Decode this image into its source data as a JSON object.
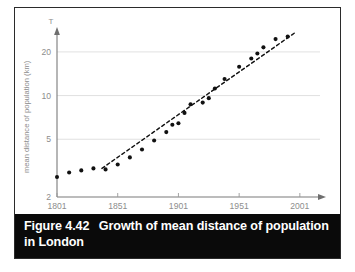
{
  "figure": {
    "caption_prefix": "Figure 4.42",
    "caption_text": "Growth of mean distance of population",
    "caption_line2": "in London",
    "caption_bg": "#0a0a0a",
    "caption_color": "#ffffff",
    "border_color": "#2b2b2b",
    "background": "#ffffff"
  },
  "chart_data": {
    "type": "scatter",
    "title": "Growth of mean distance of population in London",
    "xlabel": "",
    "ylabel": "mean distance of population (km)",
    "y_axis_marker": "T",
    "scale": "log-y",
    "grid": true,
    "grid_color": "#dcdcdc",
    "axis_color": "#7a7a7a",
    "point_color": "#111111",
    "trendline": {
      "style": "dashed",
      "color": "#111111",
      "x_start": 1838,
      "y_start": 3.15,
      "x_end": 1998,
      "y_end": 27.5
    },
    "xlim": [
      1801,
      2011
    ],
    "ylim": [
      2,
      27
    ],
    "xticks": [
      1801,
      1851,
      1901,
      1951,
      2001
    ],
    "xtick_labels": [
      "1801",
      "1851",
      "1901",
      "1951",
      "2001"
    ],
    "yticks": [
      2,
      5,
      10,
      20
    ],
    "ytick_labels": [
      "2",
      "5",
      "10",
      "20"
    ],
    "x": [
      1801,
      1811,
      1821,
      1831,
      1841,
      1851,
      1861,
      1871,
      1881,
      1891,
      1896,
      1901,
      1906,
      1911,
      1921,
      1926,
      1931,
      1939,
      1951,
      1961,
      1966,
      1971,
      1981,
      1991
    ],
    "y": [
      2.75,
      2.95,
      3.05,
      3.15,
      3.1,
      3.35,
      3.75,
      4.25,
      4.9,
      5.6,
      6.3,
      6.45,
      7.6,
      8.7,
      8.95,
      9.6,
      11.2,
      13.0,
      15.8,
      18.0,
      19.5,
      21.5,
      24.5,
      25.5
    ],
    "series": [
      {
        "name": "mean distance of population (km)",
        "values": [
          2.75,
          2.95,
          3.05,
          3.15,
          3.1,
          3.35,
          3.75,
          4.25,
          4.9,
          5.6,
          6.3,
          6.45,
          7.6,
          8.7,
          8.95,
          9.6,
          11.2,
          13.0,
          15.8,
          18.0,
          19.5,
          21.5,
          24.5,
          25.5
        ]
      }
    ]
  }
}
